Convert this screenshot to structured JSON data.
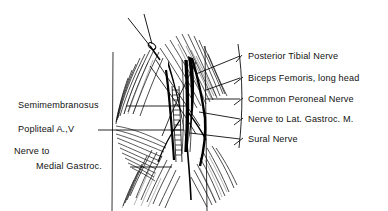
{
  "figure": {
    "background_color": "#ffffff",
    "ink_color": "#000000",
    "style": "pen-and-ink anatomical line drawing"
  },
  "labels": {
    "right": [
      {
        "id": "posterior-tibial-nerve",
        "text": "Posterior Tibial Nerve",
        "x": 248,
        "baseline": 60,
        "leader_hook_y": 57,
        "target_x": 196,
        "target_y": 74
      },
      {
        "id": "biceps-femoris-long-head",
        "text": "Biceps Femoris, long head",
        "x": 248,
        "baseline": 82,
        "leader_hook_y": 79,
        "target_x": 206,
        "target_y": 90
      },
      {
        "id": "common-peroneal-nerve",
        "text": "Common Peroneal Nerve",
        "x": 248,
        "baseline": 103,
        "leader_hook_y": 100,
        "target_x": 205,
        "target_y": 99
      },
      {
        "id": "nerve-to-lat-gastroc",
        "text": "Nerve to Lat. Gastroc. M.",
        "x": 248,
        "baseline": 123,
        "leader_hook_y": 120,
        "target_x": 199,
        "target_y": 112
      },
      {
        "id": "sural-nerve",
        "text": "Sural Nerve",
        "x": 248,
        "baseline": 143,
        "leader_hook_y": 140,
        "target_x": 190,
        "target_y": 133
      }
    ],
    "left": [
      {
        "id": "semimembranosus",
        "text": "Semimembranosus",
        "x": 18,
        "baseline": 109,
        "leader_from_x": 128,
        "leader_to_x": 186,
        "leader_y": 106
      },
      {
        "id": "popliteal-artery-vein",
        "text": "Popliteal A.,V",
        "x": 18,
        "baseline": 133,
        "leader_from_x": 98,
        "leader_to_x": 182,
        "leader_y": 130
      },
      {
        "id": "nerve-to-medial-gastroc-line1",
        "text": "Nerve to",
        "x": 14,
        "baseline": 155,
        "indent": 0
      },
      {
        "id": "nerve-to-medial-gastroc-line2",
        "text": "Medial Gastroc.",
        "x": 36,
        "baseline": 170,
        "leader_from_x": 130,
        "leader_to_x": 170,
        "leader_y": 167
      }
    ]
  },
  "anatomy": {
    "structures": [
      "skin incision margins",
      "biceps femoris long head",
      "semimembranosus",
      "popliteal artery and vein",
      "posterior tibial nerve",
      "common peroneal nerve",
      "sural nerve",
      "nerve to lateral gastrocnemius",
      "nerve to medial gastrocnemius",
      "medial head of gastrocnemius",
      "lateral head of gastrocnemius",
      "retractor instrument"
    ],
    "drawing_bounds": {
      "left": 95,
      "right": 245,
      "top": 12,
      "bottom": 211
    }
  }
}
